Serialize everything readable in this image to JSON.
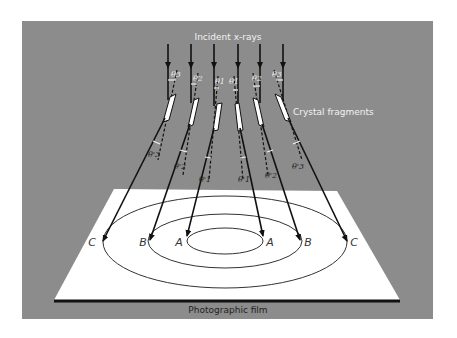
{
  "diagram": {
    "type": "x-ray powder diffraction schematic",
    "colors": {
      "background_panel": "#8c8c8c",
      "film": "#ffffff",
      "beam": "#111111",
      "crystal": "#ffffff",
      "label_text_light": "#f2f2f2",
      "label_text_dark": "#222222"
    },
    "labels": {
      "incident": "Incident x-rays",
      "crystals": "Crystal fragments",
      "film": "Photographic film"
    },
    "rings": [
      {
        "name": "A",
        "left_label": "A",
        "right_label": "A"
      },
      {
        "name": "B",
        "left_label": "B",
        "right_label": "B"
      },
      {
        "name": "C",
        "left_label": "C",
        "right_label": "C"
      }
    ],
    "angle_labels_top": [
      "θ3",
      "θ2",
      "θ1",
      "θ1",
      "θ2",
      "θ3"
    ],
    "angle_labels_bottom": [
      "θ'3",
      "θ'2",
      "θ'1",
      "θ'1",
      "θ'2",
      "θ'3"
    ],
    "incident_beam_count": 6
  }
}
